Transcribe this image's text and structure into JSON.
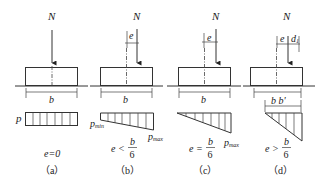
{
  "figure": {
    "load_label": "N",
    "width_label": "b",
    "eccentricity_label": "e",
    "panels": [
      {
        "id": "a",
        "label": "（a）",
        "condition": "e=0",
        "pressure_labels": {
          "uniform": "p"
        },
        "distribution": "rectangle"
      },
      {
        "id": "b",
        "label": "（b）",
        "condition_lhs": "e <",
        "condition_num": "b",
        "condition_den": "6",
        "pressure_labels": {
          "min": "p",
          "min_sub": "min",
          "max": "p",
          "max_sub": "max"
        },
        "distribution": "trapezoid"
      },
      {
        "id": "c",
        "label": "（c）",
        "condition_lhs": "e =",
        "condition_num": "b",
        "condition_den": "6",
        "pressure_labels": {
          "max": "p",
          "max_sub": "max"
        },
        "distribution": "triangle"
      },
      {
        "id": "d",
        "label": "（d）",
        "condition_lhs": "e >",
        "condition_num": "b",
        "condition_den": "6",
        "extra_labels": {
          "d": "d",
          "d_sub": "1",
          "b_prime": "b b'"
        },
        "distribution": "partial-triangle"
      }
    ]
  }
}
